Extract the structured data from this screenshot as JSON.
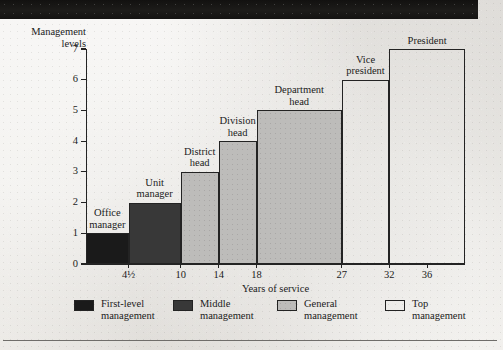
{
  "figure": {
    "y_axis_title_line1": "Management",
    "y_axis_title_line2": "levels"
  },
  "chart_data": {
    "type": "bar",
    "title": "",
    "xlabel": "Years of service",
    "ylabel": "Management levels",
    "ylim": [
      0,
      7
    ],
    "xlim": [
      0,
      40
    ],
    "grid": false,
    "legend_position": "bottom",
    "y_ticks": [
      "7",
      "6",
      "5",
      "4",
      "3",
      "2",
      "1",
      "0"
    ],
    "x_ticks": [
      "4½",
      "10",
      "14",
      "18",
      "27",
      "32",
      "36"
    ],
    "categories": [
      "Office manager",
      "Unit manager",
      "District head",
      "Division head",
      "Department head",
      "Vice president",
      "President"
    ],
    "values": [
      1,
      2,
      3,
      4,
      5,
      6,
      7
    ],
    "bar_labels_line1": [
      "Office",
      "Unit",
      "District",
      "Division",
      "Department",
      "Vice",
      "President"
    ],
    "bar_labels_line2": [
      "manager",
      "manager",
      "head",
      "head",
      "head",
      "president",
      ""
    ],
    "x_start": [
      0,
      4.5,
      10,
      14,
      18,
      27,
      32
    ],
    "x_end": [
      4.5,
      10,
      14,
      18,
      27,
      32,
      40
    ],
    "fills": [
      "black",
      "dark",
      "light",
      "light",
      "light",
      "white",
      "white"
    ],
    "series": [
      {
        "name": "Management levels",
        "values": [
          1,
          2,
          3,
          4,
          5,
          6,
          7
        ]
      }
    ],
    "legend": [
      {
        "label_line1": "First-level",
        "label_line2": "management",
        "fill": "black",
        "color": "#1a1a1a"
      },
      {
        "label_line1": "Middle",
        "label_line2": "management",
        "fill": "dark",
        "color": "#383838"
      },
      {
        "label_line1": "General",
        "label_line2": "management",
        "fill": "light",
        "color": "#bdbcba"
      },
      {
        "label_line1": "Top",
        "label_line2": "management",
        "fill": "white",
        "color": "#ffffff"
      }
    ]
  }
}
